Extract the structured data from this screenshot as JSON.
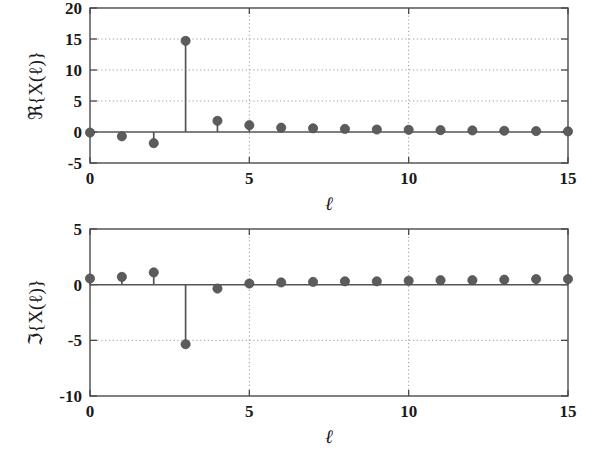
{
  "figure": {
    "background_color": "#ffffff",
    "marker_color": "#5c5c5c",
    "line_color": "#555555",
    "grid_color": "#9a9a9a",
    "axis_color": "#4a4a4a"
  },
  "chart_data": [
    {
      "type": "stem",
      "id": "real-part",
      "title": "",
      "xlabel": "ℓ",
      "ylabel": "ℜ{X(ℓ)}",
      "x": [
        0,
        1,
        2,
        3,
        4,
        5,
        6,
        7,
        8,
        9,
        10,
        11,
        12,
        13,
        14,
        15
      ],
      "values": [
        -0.1,
        -0.7,
        -1.8,
        14.7,
        1.8,
        1.1,
        0.7,
        0.6,
        0.5,
        0.4,
        0.35,
        0.3,
        0.25,
        0.2,
        0.15,
        0.1
      ],
      "xlim": [
        0,
        15
      ],
      "ylim": [
        -5,
        20
      ],
      "xticks": [
        0,
        5,
        10,
        15
      ],
      "xticklabels": [
        "0",
        "5",
        "10",
        "15"
      ],
      "yticks": [
        -5,
        0,
        5,
        10,
        15,
        20
      ],
      "yticklabels": [
        "-5",
        "0",
        "5",
        "10",
        "15",
        "20"
      ],
      "gridlines_y": [
        5,
        10,
        15
      ],
      "gridlines_x": [
        5,
        10
      ],
      "grid": true,
      "legend": "none"
    },
    {
      "type": "stem",
      "id": "imaginary-part",
      "title": "",
      "xlabel": "ℓ",
      "ylabel": "ℑ{X(ℓ)}",
      "x": [
        0,
        1,
        2,
        3,
        4,
        5,
        6,
        7,
        8,
        9,
        10,
        11,
        12,
        13,
        14,
        15
      ],
      "values": [
        0.55,
        0.7,
        1.1,
        -5.35,
        -0.35,
        0.1,
        0.2,
        0.25,
        0.3,
        0.3,
        0.35,
        0.4,
        0.4,
        0.45,
        0.5,
        0.5
      ],
      "xlim": [
        0,
        15
      ],
      "ylim": [
        -10,
        5
      ],
      "xticks": [
        0,
        5,
        10,
        15
      ],
      "xticklabels": [
        "0",
        "5",
        "10",
        "15"
      ],
      "yticks": [
        -10,
        -5,
        0,
        5
      ],
      "yticklabels": [
        "-10",
        "-5",
        "0",
        "5"
      ],
      "gridlines_y": [
        -5
      ],
      "gridlines_x": [
        5,
        10
      ],
      "grid": true,
      "legend": "none"
    }
  ],
  "panels": [
    {
      "name": "real-part-panel",
      "plot_box": {
        "left": 90,
        "top": 8,
        "right": 568,
        "bottom": 163
      }
    },
    {
      "name": "imaginary-part-panel",
      "plot_box": {
        "left": 90,
        "top": 229,
        "right": 568,
        "bottom": 396
      }
    }
  ]
}
